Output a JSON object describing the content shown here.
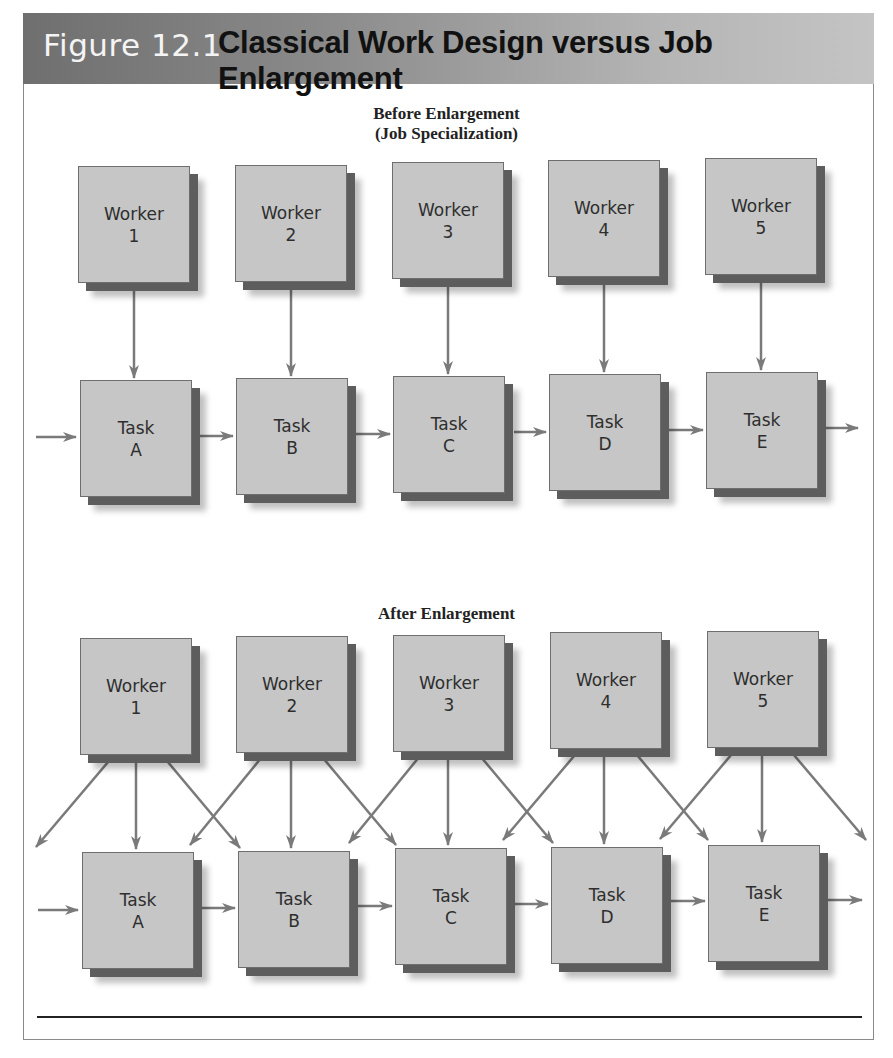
{
  "figure": {
    "label": "Figure 12.1",
    "title": "Classical Work Design versus Job Enlargement",
    "header_gradient": [
      "#6f6f6f",
      "#c4c4c4"
    ],
    "box_fill": "#c6c6c6",
    "arrow_color": "#7a7a7a"
  },
  "before": {
    "title_line1": "Before Enlargement",
    "title_line2": "(Job Specialization)",
    "workers": [
      {
        "label": "Worker",
        "id": "1"
      },
      {
        "label": "Worker",
        "id": "2"
      },
      {
        "label": "Worker",
        "id": "3"
      },
      {
        "label": "Worker",
        "id": "4"
      },
      {
        "label": "Worker",
        "id": "5"
      }
    ],
    "tasks": [
      {
        "label": "Task",
        "id": "A"
      },
      {
        "label": "Task",
        "id": "B"
      },
      {
        "label": "Task",
        "id": "C"
      },
      {
        "label": "Task",
        "id": "D"
      },
      {
        "label": "Task",
        "id": "E"
      }
    ],
    "connections": "Each worker assigned to exactly one task (1→A, 2→B, 3→C, 4→D, 5→E); tasks flow sequentially A→B→C→D→E"
  },
  "after": {
    "title": "After Enlargement",
    "workers": [
      {
        "label": "Worker",
        "id": "1"
      },
      {
        "label": "Worker",
        "id": "2"
      },
      {
        "label": "Worker",
        "id": "3"
      },
      {
        "label": "Worker",
        "id": "4"
      },
      {
        "label": "Worker",
        "id": "5"
      }
    ],
    "tasks": [
      {
        "label": "Task",
        "id": "A"
      },
      {
        "label": "Task",
        "id": "B"
      },
      {
        "label": "Task",
        "id": "C"
      },
      {
        "label": "Task",
        "id": "D"
      },
      {
        "label": "Task",
        "id": "E"
      }
    ],
    "connections": "Each worker has three arrows: to the previous, same, and next task; tasks flow sequentially A→B→C→D→E"
  }
}
